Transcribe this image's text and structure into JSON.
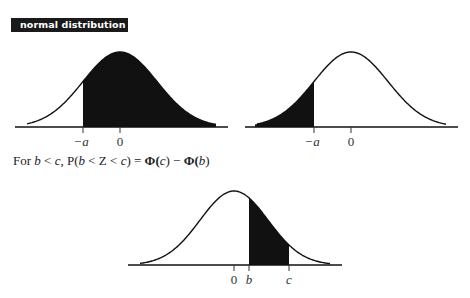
{
  "header": {
    "title": "normal distribution"
  },
  "formula": {
    "prefix": "For",
    "condition_lhs": "b",
    "condition_op": "<",
    "condition_rhs": "c",
    "sep": ",",
    "prob": "P(",
    "prob_b": "b",
    "prob_op1": "<",
    "prob_z": "Z",
    "prob_op2": "<",
    "prob_c": "c",
    "prob_close": ")",
    "equals": "=",
    "phi1": "Φ(",
    "phi1_arg": "c",
    "phi1_close": ")",
    "minus": "−",
    "phi2": "Φ(",
    "phi2_arg": "b",
    "phi2_close": ")",
    "full_text": "For b < c, P(b < Z < c) = Φ(c) − Φ(b)"
  },
  "diagrams": [
    {
      "id": "upper-tail-from-minus-a",
      "shaded_region": "x > -a",
      "tick_labels": [
        "−a",
        "0"
      ]
    },
    {
      "id": "lower-tail-to-minus-a",
      "shaded_region": "x < -a",
      "tick_labels": [
        "−a",
        "0"
      ]
    },
    {
      "id": "between-b-and-c",
      "shaded_region": "b < x < c",
      "tick_labels": [
        "0",
        "b",
        "c"
      ]
    }
  ],
  "colors": {
    "fill": "#111111",
    "curve": "#111111",
    "label_bg": "#1a1a1a",
    "label_text": "#ffffff"
  }
}
